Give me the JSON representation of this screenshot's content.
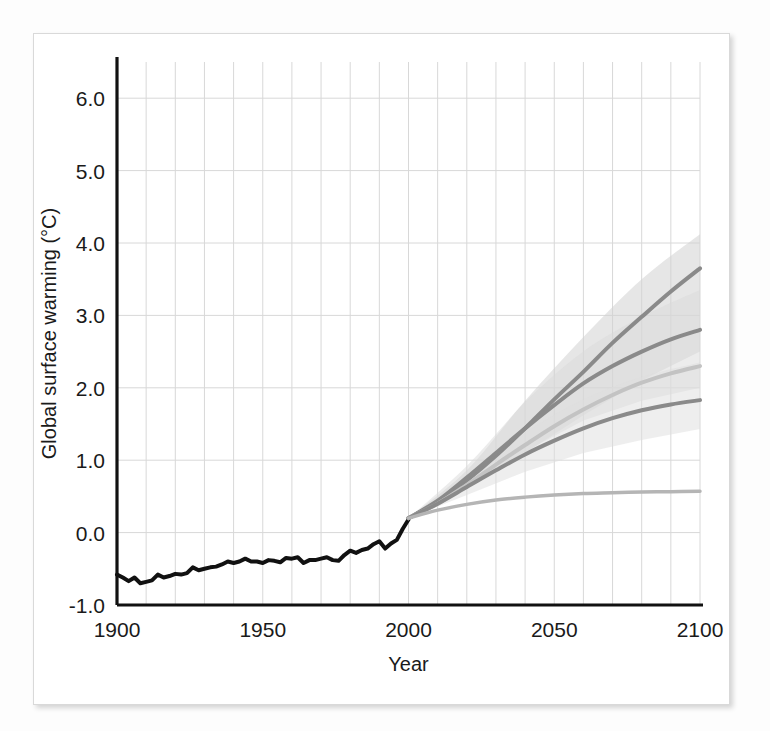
{
  "figure": {
    "background": "#ffffff",
    "card_border": "#d9d9d9"
  },
  "chart_data": {
    "type": "line",
    "title": "",
    "xlabel": "Year",
    "ylabel": "Global surface warming (°C)",
    "xlim": [
      1900,
      2100
    ],
    "ylim": [
      -1.0,
      6.5
    ],
    "xticks": [
      1900,
      1950,
      2000,
      2050,
      2100
    ],
    "xtick_labels": [
      "1900",
      "1950",
      "2000",
      "2050",
      "2100"
    ],
    "yticks": [
      -1.0,
      0.0,
      1.0,
      2.0,
      3.0,
      4.0,
      5.0,
      6.0
    ],
    "ytick_labels": [
      "-1.0",
      "0.0",
      "1.0",
      "2.0",
      "3.0",
      "4.0",
      "5.0",
      "6.0"
    ],
    "grid": true,
    "grid_minor_x_step": 10,
    "grid_color": "#d8d8d8",
    "legend": "none",
    "series": [
      {
        "name": "Observed (20th century)",
        "type": "line",
        "color": "#111111",
        "width": 4.0,
        "x": [
          1900,
          1902,
          1904,
          1906,
          1908,
          1910,
          1912,
          1914,
          1916,
          1918,
          1920,
          1922,
          1924,
          1926,
          1928,
          1930,
          1932,
          1934,
          1936,
          1938,
          1940,
          1942,
          1944,
          1946,
          1948,
          1950,
          1952,
          1954,
          1956,
          1958,
          1960,
          1962,
          1964,
          1966,
          1968,
          1970,
          1972,
          1974,
          1976,
          1978,
          1980,
          1982,
          1984,
          1986,
          1988,
          1990,
          1992,
          1994,
          1996,
          1998,
          2000
        ],
        "values": [
          -0.58,
          -0.62,
          -0.67,
          -0.62,
          -0.7,
          -0.68,
          -0.66,
          -0.58,
          -0.62,
          -0.6,
          -0.57,
          -0.58,
          -0.56,
          -0.48,
          -0.52,
          -0.5,
          -0.48,
          -0.47,
          -0.44,
          -0.4,
          -0.42,
          -0.4,
          -0.36,
          -0.4,
          -0.4,
          -0.42,
          -0.38,
          -0.39,
          -0.41,
          -0.35,
          -0.36,
          -0.34,
          -0.42,
          -0.38,
          -0.38,
          -0.36,
          -0.34,
          -0.38,
          -0.39,
          -0.31,
          -0.25,
          -0.28,
          -0.24,
          -0.22,
          -0.16,
          -0.12,
          -0.22,
          -0.15,
          -0.1,
          0.05,
          0.18
        ]
      },
      {
        "name": "A2",
        "type": "line",
        "color": "#8a8a8a",
        "width": 4.0,
        "x": [
          2000,
          2010,
          2020,
          2030,
          2040,
          2050,
          2060,
          2070,
          2080,
          2090,
          2100
        ],
        "values": [
          0.2,
          0.42,
          0.72,
          1.06,
          1.44,
          1.84,
          2.22,
          2.62,
          2.98,
          3.33,
          3.65
        ]
      },
      {
        "name": "A1B",
        "type": "line",
        "color": "#8a8a8a",
        "width": 4.0,
        "x": [
          2000,
          2010,
          2020,
          2030,
          2040,
          2050,
          2060,
          2070,
          2080,
          2090,
          2100
        ],
        "values": [
          0.2,
          0.44,
          0.76,
          1.1,
          1.44,
          1.76,
          2.06,
          2.3,
          2.5,
          2.67,
          2.8
        ]
      },
      {
        "name": "Intermediate scenario",
        "type": "line",
        "color": "#c3c3c3",
        "width": 4.0,
        "x": [
          2000,
          2010,
          2020,
          2030,
          2040,
          2050,
          2060,
          2070,
          2080,
          2090,
          2100
        ],
        "values": [
          0.2,
          0.4,
          0.66,
          0.94,
          1.21,
          1.47,
          1.7,
          1.9,
          2.07,
          2.2,
          2.3
        ]
      },
      {
        "name": "B1",
        "type": "line",
        "color": "#8a8a8a",
        "width": 4.0,
        "x": [
          2000,
          2010,
          2020,
          2030,
          2040,
          2050,
          2060,
          2070,
          2080,
          2090,
          2100
        ],
        "values": [
          0.2,
          0.4,
          0.63,
          0.86,
          1.08,
          1.27,
          1.44,
          1.58,
          1.69,
          1.77,
          1.83
        ]
      },
      {
        "name": "Constant composition commitment",
        "type": "line",
        "color": "#b5b5b5",
        "width": 3.5,
        "x": [
          2000,
          2010,
          2020,
          2030,
          2040,
          2050,
          2060,
          2070,
          2080,
          2090,
          2100
        ],
        "values": [
          0.2,
          0.31,
          0.39,
          0.45,
          0.49,
          0.52,
          0.54,
          0.55,
          0.56,
          0.565,
          0.57
        ]
      }
    ],
    "bands": [
      {
        "name": "A2 uncertainty",
        "color": "#d2d2d2",
        "opacity": 0.55,
        "x": [
          2000,
          2020,
          2040,
          2060,
          2080,
          2100
        ],
        "lower": [
          0.2,
          0.6,
          1.1,
          1.62,
          2.1,
          2.5
        ],
        "upper": [
          0.2,
          0.86,
          1.82,
          2.7,
          3.5,
          4.12
        ]
      },
      {
        "name": "A1B uncertainty",
        "color": "#d9d9d9",
        "opacity": 0.5,
        "x": [
          2000,
          2020,
          2040,
          2060,
          2080,
          2100
        ],
        "lower": [
          0.2,
          0.62,
          1.12,
          1.55,
          1.82,
          2.0
        ],
        "upper": [
          0.2,
          0.92,
          1.8,
          2.5,
          2.98,
          3.35
        ]
      },
      {
        "name": "B1 uncertainty",
        "color": "#dedede",
        "opacity": 0.5,
        "x": [
          2000,
          2020,
          2040,
          2060,
          2080,
          2100
        ],
        "lower": [
          0.2,
          0.52,
          0.84,
          1.1,
          1.28,
          1.43
        ],
        "upper": [
          0.2,
          0.78,
          1.38,
          1.84,
          2.15,
          2.35
        ]
      }
    ]
  }
}
